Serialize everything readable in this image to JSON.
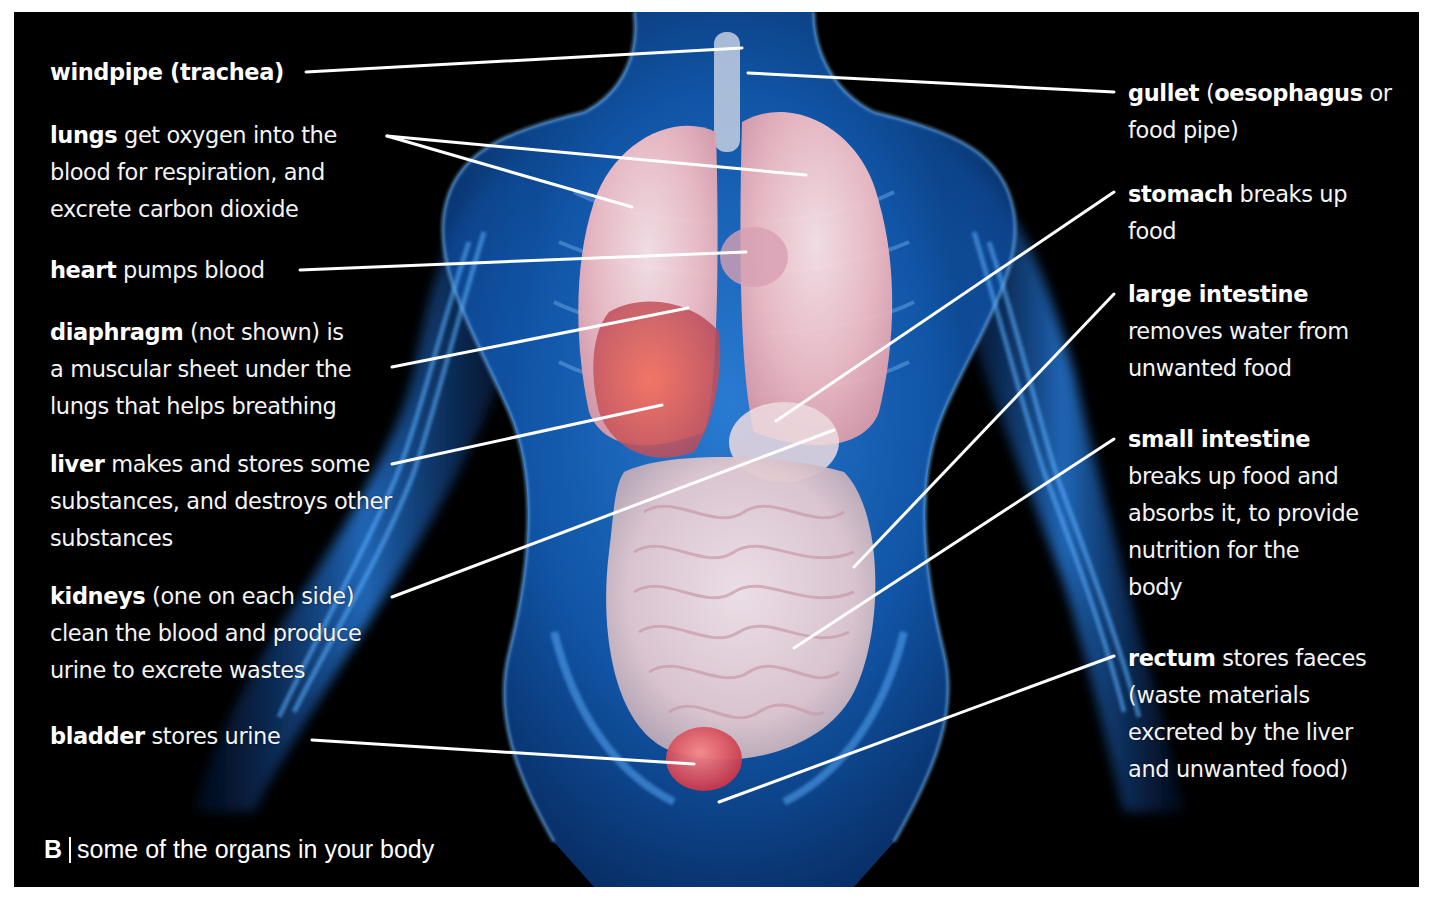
{
  "figure": {
    "background_color": "#000000",
    "body_color": "#1e7fe0",
    "organ_colors": {
      "lungs": "#f3c9cf",
      "liver": "#e2554c",
      "intestine": "#efd9df",
      "bladder": "#d9404a"
    },
    "leader_line_color": "#ffffff"
  },
  "labels_left": [
    {
      "id": "windpipe",
      "term": "windpipe (trachea)",
      "lines": [
        ""
      ]
    },
    {
      "id": "lungs",
      "term": "lungs",
      "lines": [
        " get oxygen into the",
        "blood for respiration, and",
        "excrete carbon dioxide"
      ]
    },
    {
      "id": "heart",
      "term": "heart",
      "lines": [
        " pumps blood"
      ]
    },
    {
      "id": "diaphragm",
      "term": "diaphragm",
      "lines": [
        " (not shown) is",
        "a muscular sheet under the",
        "lungs that helps breathing"
      ]
    },
    {
      "id": "liver",
      "term": "liver",
      "lines": [
        " makes and stores some",
        "substances, and destroys other",
        "substances"
      ]
    },
    {
      "id": "kidneys",
      "term": "kidneys",
      "lines": [
        " (one on each side)",
        "clean the blood and produce",
        "urine to excrete wastes"
      ]
    },
    {
      "id": "bladder",
      "term": "bladder",
      "lines": [
        " stores urine"
      ]
    }
  ],
  "labels_right": [
    {
      "id": "gullet",
      "term": "gullet",
      "term2": "oesophagus",
      "lines": [
        " (",
        " or",
        "food pipe)"
      ]
    },
    {
      "id": "stomach",
      "term": "stomach",
      "lines": [
        " breaks up",
        "food"
      ]
    },
    {
      "id": "large-intestine",
      "term": "large intestine",
      "lines": [
        "",
        "removes water from",
        "unwanted food"
      ]
    },
    {
      "id": "small-intestine",
      "term": "small intestine",
      "lines": [
        "",
        "breaks up food and",
        "absorbs it, to provide",
        "nutrition for the",
        "body"
      ]
    },
    {
      "id": "rectum",
      "term": "rectum",
      "lines": [
        " stores faeces",
        "(waste materials",
        "excreted by the liver",
        "and unwanted food)"
      ]
    }
  ],
  "caption": {
    "letter": "B",
    "text": "some of the organs in your body"
  }
}
